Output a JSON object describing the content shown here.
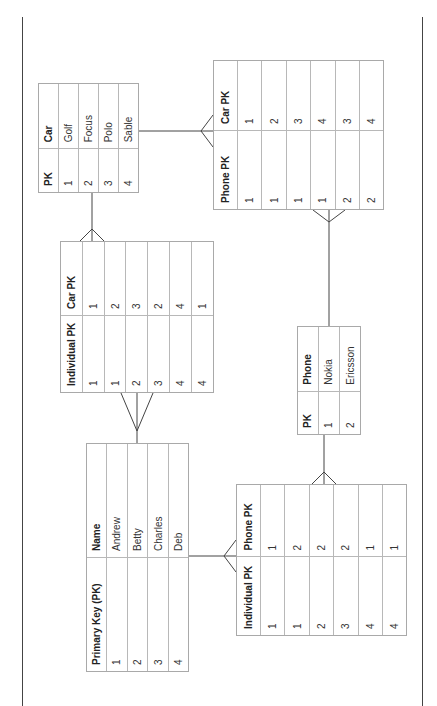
{
  "diagram": {
    "type": "entity-relationship",
    "orientation": "rotated-90-counterclockwise",
    "tables": {
      "individual": {
        "headers": [
          "Primary Key (PK)",
          "Name"
        ],
        "rows": [
          [
            "1",
            "Andrew"
          ],
          [
            "2",
            "Betty"
          ],
          [
            "3",
            "Charles"
          ],
          [
            "4",
            "Deb"
          ]
        ]
      },
      "car": {
        "headers": [
          "PK",
          "Car"
        ],
        "rows": [
          [
            "1",
            "Golf"
          ],
          [
            "2",
            "Focus"
          ],
          [
            "3",
            "Polo"
          ],
          [
            "4",
            "Sable"
          ]
        ]
      },
      "phone": {
        "headers": [
          "PK",
          "Phone"
        ],
        "rows": [
          [
            "1",
            "Nokia"
          ],
          [
            "2",
            "Ericsson"
          ]
        ]
      },
      "individual_car": {
        "headers": [
          "Individual PK",
          "Car PK"
        ],
        "rows": [
          [
            "1",
            "1"
          ],
          [
            "1",
            "2"
          ],
          [
            "2",
            "3"
          ],
          [
            "3",
            "2"
          ],
          [
            "4",
            "4"
          ],
          [
            "4",
            "1"
          ]
        ]
      },
      "individual_phone": {
        "headers": [
          "Individual PK",
          "Phone PK"
        ],
        "rows": [
          [
            "1",
            "1"
          ],
          [
            "1",
            "2"
          ],
          [
            "2",
            "2"
          ],
          [
            "3",
            "2"
          ],
          [
            "4",
            "1"
          ],
          [
            "4",
            "1"
          ]
        ]
      },
      "phone_car": {
        "headers": [
          "Phone PK",
          "Car PK"
        ],
        "rows": [
          [
            "1",
            "1"
          ],
          [
            "1",
            "2"
          ],
          [
            "1",
            "3"
          ],
          [
            "1",
            "4"
          ],
          [
            "2",
            "3"
          ],
          [
            "2",
            "4"
          ]
        ]
      }
    },
    "relationships": [
      {
        "from": "individual",
        "to": "individual_car",
        "type": "one-to-many"
      },
      {
        "from": "individual",
        "to": "individual_phone",
        "type": "one-to-many"
      },
      {
        "from": "car",
        "to": "individual_car",
        "type": "one-to-many"
      },
      {
        "from": "car",
        "to": "phone_car",
        "type": "one-to-many"
      },
      {
        "from": "phone",
        "to": "phone_car",
        "type": "one-to-many"
      },
      {
        "from": "phone",
        "to": "individual_phone",
        "type": "one-to-many"
      }
    ],
    "colors": {
      "line": "#444444",
      "cell_border": "#b8b8b8",
      "text": "#333333"
    }
  }
}
